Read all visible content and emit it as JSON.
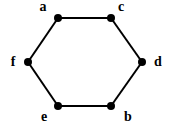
{
  "diagram": {
    "type": "graph",
    "shape": "hexagon",
    "nodes": [
      {
        "id": "a",
        "label": "a",
        "x": 58,
        "y": 18,
        "lx": 43,
        "ly": 11
      },
      {
        "id": "c",
        "label": "c",
        "x": 111,
        "y": 18,
        "lx": 121,
        "ly": 11
      },
      {
        "id": "d",
        "label": "d",
        "x": 142,
        "y": 62,
        "lx": 158,
        "ly": 66
      },
      {
        "id": "b",
        "label": "b",
        "x": 111,
        "y": 106,
        "lx": 128,
        "ly": 121
      },
      {
        "id": "e",
        "label": "e",
        "x": 58,
        "y": 106,
        "lx": 44,
        "ly": 121
      },
      {
        "id": "f",
        "label": "f",
        "x": 28,
        "y": 62,
        "lx": 13,
        "ly": 66
      }
    ],
    "edges": [
      {
        "from": "a",
        "to": "c"
      },
      {
        "from": "c",
        "to": "d"
      },
      {
        "from": "d",
        "to": "b"
      },
      {
        "from": "b",
        "to": "e"
      },
      {
        "from": "e",
        "to": "f"
      },
      {
        "from": "f",
        "to": "a"
      }
    ],
    "colors": {
      "edge": "#000000",
      "node": "#000000",
      "label": "#000000",
      "background": "#ffffff"
    }
  }
}
